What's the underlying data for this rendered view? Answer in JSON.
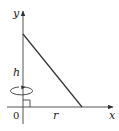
{
  "diagram": {
    "axes": {
      "x_label": "x",
      "y_label": "y",
      "origin_label": "0"
    },
    "labels": {
      "height": "h",
      "radius": "r"
    },
    "colors": {
      "stroke": "#333333",
      "text": "#222222",
      "background": "#ffffff"
    }
  }
}
